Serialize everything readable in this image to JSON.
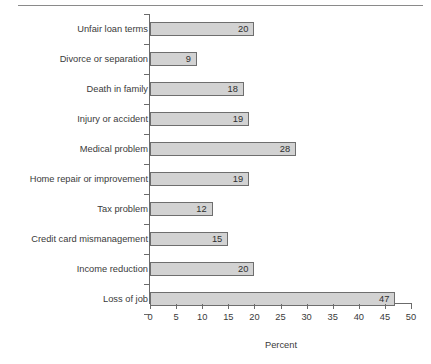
{
  "chart_data": {
    "type": "bar",
    "orientation": "horizontal",
    "title": "",
    "subtitle": "",
    "xlabel": "Percent",
    "ylabel": "",
    "xlim": [
      0,
      50
    ],
    "xticks": [
      0,
      5,
      10,
      15,
      20,
      25,
      30,
      35,
      40,
      45,
      50
    ],
    "grid": false,
    "legend": false,
    "bar_fill_color": "#d2d2d2",
    "bar_edge_color": "#6e6e6e",
    "axis_color": "#6b6b6b",
    "text_color": "#3a3a3a",
    "value_labels_inside_bars": true,
    "categories": [
      "Unfair loan terms",
      "Divorce or separation",
      "Death in family",
      "Injury or accident",
      "Medical problem",
      "Home repair or improvement",
      "Tax problem",
      "Credit card mismanagement",
      "Income reduction",
      "Loss of job"
    ],
    "values": [
      20,
      9,
      18,
      19,
      28,
      19,
      12,
      15,
      20,
      47
    ],
    "points": [
      {
        "category": "Unfair loan terms",
        "value": 20
      },
      {
        "category": "Divorce or separation",
        "value": 9
      },
      {
        "category": "Death in family",
        "value": 18
      },
      {
        "category": "Injury or accident",
        "value": 19
      },
      {
        "category": "Medical problem",
        "value": 28
      },
      {
        "category": "Home repair or improvement",
        "value": 19
      },
      {
        "category": "Tax problem",
        "value": 12
      },
      {
        "category": "Credit card mismanagement",
        "value": 15
      },
      {
        "category": "Income reduction",
        "value": 20
      },
      {
        "category": "Loss of job",
        "value": 47
      }
    ]
  }
}
